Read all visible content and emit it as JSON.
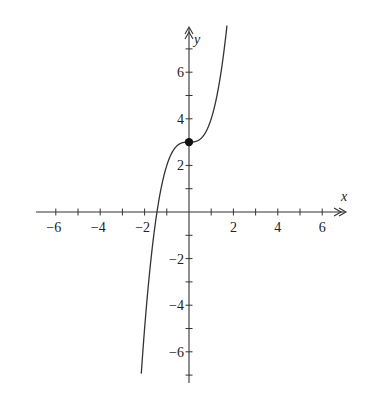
{
  "chart_data": {
    "type": "line",
    "title": "",
    "function": "y = x^3 + 3",
    "xlabel": "x",
    "ylabel": "y",
    "xlim": [
      -7,
      7
    ],
    "ylim": [
      -7,
      7
    ],
    "grid": false,
    "x_ticks": [
      -6,
      -5,
      -4,
      -3,
      -2,
      -1,
      1,
      2,
      3,
      4,
      5,
      6
    ],
    "x_tick_labels": [
      "-6",
      "-4",
      "-2",
      "2",
      "4",
      "6"
    ],
    "y_ticks": [
      -7,
      -6,
      -5,
      -4,
      -3,
      -2,
      -1,
      1,
      2,
      3,
      4,
      5,
      6,
      7
    ],
    "y_tick_labels": [
      "6",
      "4",
      "2",
      "-2",
      "-4",
      "-6"
    ],
    "series": [
      {
        "name": "curve",
        "x": [
          -2.15,
          -2,
          -1.75,
          -1.5,
          -1.25,
          -1,
          -0.75,
          -0.5,
          -0.25,
          0,
          0.25,
          0.5,
          0.75,
          1,
          1.25,
          1.5,
          1.71
        ],
        "y": [
          -6.94,
          -5,
          -2.36,
          -0.38,
          1.05,
          2,
          2.58,
          2.88,
          2.98,
          3,
          3.02,
          3.13,
          3.42,
          4,
          4.95,
          6.38,
          8.0
        ]
      }
    ],
    "points": [
      {
        "label": "inflection",
        "x": 0,
        "y": 3,
        "filled": true
      }
    ]
  },
  "axes": {
    "x_label": "x",
    "y_label": "y",
    "x_tick_text": [
      "−6",
      "−4",
      "−2",
      "2",
      "4",
      "6"
    ],
    "y_tick_text": [
      "6",
      "4",
      "2",
      "−2",
      "−4",
      "−6"
    ]
  }
}
